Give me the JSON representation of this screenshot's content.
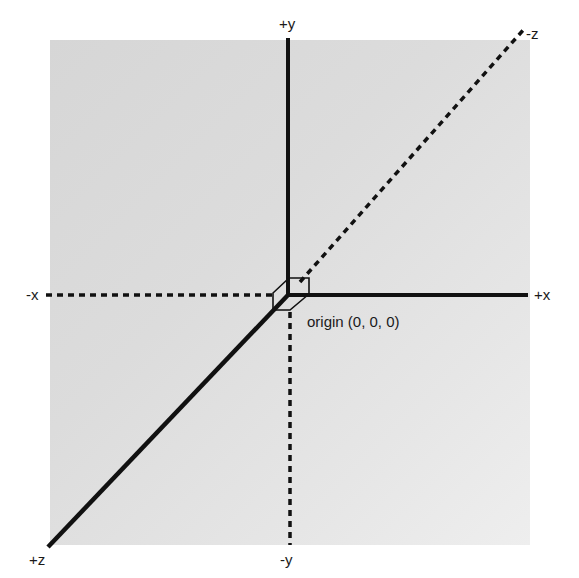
{
  "labels": {
    "pos_y": "+y",
    "neg_y": "-y",
    "pos_x": "+x",
    "neg_x": "-x",
    "pos_z": "+z",
    "neg_z": "-z",
    "origin": "origin (0, 0, 0)"
  },
  "colors": {
    "axis": "#111111",
    "panel": "#dcdcdc",
    "background": "#ffffff"
  }
}
